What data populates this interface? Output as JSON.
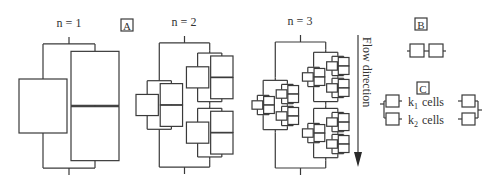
{
  "panels": {
    "A": {
      "label": "A"
    },
    "B": {
      "label": "B"
    },
    "C": {
      "label": "C"
    }
  },
  "levels": [
    {
      "label": "n = 1",
      "n": 1,
      "x": 19,
      "y": 37,
      "w": 100,
      "h": 138,
      "label_x": 69,
      "label_y": 27
    },
    {
      "label": "n = 2",
      "n": 2,
      "x": 136,
      "y": 36,
      "w": 97,
      "h": 138,
      "label_x": 184,
      "label_y": 26
    },
    {
      "label": "n = 3",
      "n": 3,
      "x": 252,
      "y": 35,
      "w": 97,
      "h": 140,
      "label_x": 300,
      "label_y": 25
    }
  ],
  "flow": {
    "label": "Flow direction",
    "x": 358,
    "y1": 35,
    "y2": 166
  },
  "legend": {
    "k1_label": "k",
    "k1_sub": "1",
    "k2_label": "k",
    "k2_sub": "2",
    "cells_word": "cells"
  }
}
